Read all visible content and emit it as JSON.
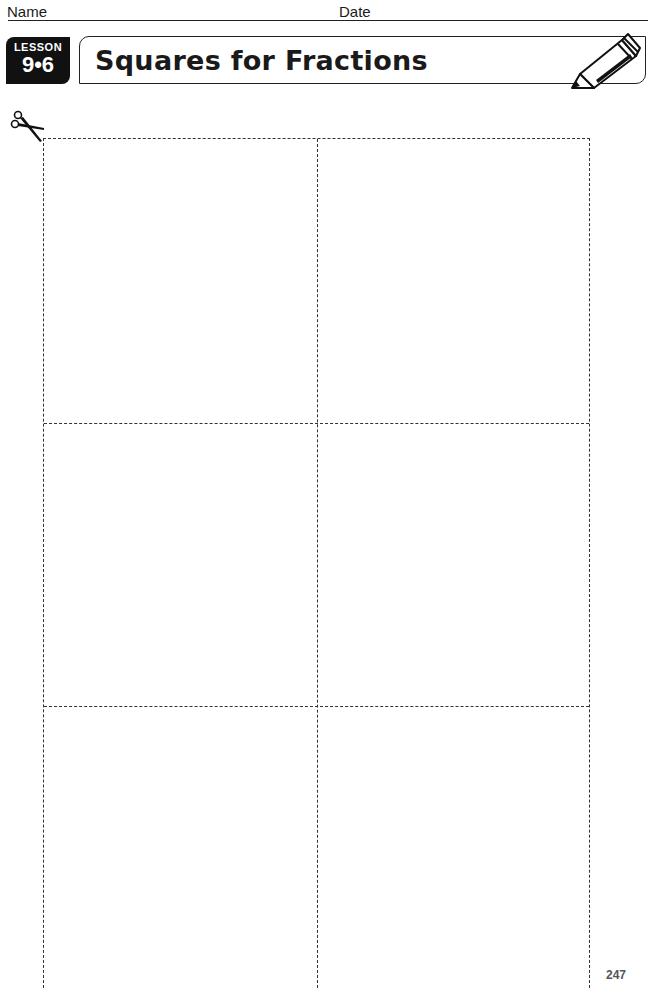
{
  "header": {
    "name_label": "Name",
    "date_label": "Date"
  },
  "lesson": {
    "word": "LESSON",
    "number": "9•6"
  },
  "title": "Squares for Fractions",
  "icons": {
    "pencil": "pencil-icon",
    "scissors": "scissors-icon"
  },
  "grid": {
    "rows": 3,
    "columns": 2,
    "line_style": "dashed",
    "row_lines_y": [
      285,
      568
    ]
  },
  "footer": {
    "page_number": "247"
  }
}
